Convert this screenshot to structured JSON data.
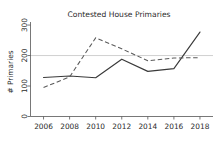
{
  "chart_data": {
    "type": "line",
    "title": "Contested House Primaries",
    "xlabel": "",
    "ylabel": "# Primaries",
    "x": [
      2006,
      2008,
      2010,
      2012,
      2014,
      2016,
      2018
    ],
    "xticklabels": [
      "2006",
      "2008",
      "2010",
      "2012",
      "2014",
      "2016",
      "2018"
    ],
    "yticklabels": [
      "0",
      "100",
      "200",
      "300"
    ],
    "yticks": [
      0,
      100,
      200,
      300
    ],
    "xlim": [
      2005,
      2019
    ],
    "ylim": [
      0,
      310
    ],
    "grid": false,
    "legend": "none",
    "series": [
      {
        "name": "solid",
        "style": "solid",
        "color": "#3a3a3a",
        "values": [
          128,
          133,
          127,
          188,
          148,
          157,
          277
        ]
      },
      {
        "name": "dashed",
        "style": "dashed",
        "color": "#5a5a5a",
        "values": [
          95,
          130,
          258,
          222,
          183,
          192,
          193
        ]
      }
    ]
  }
}
